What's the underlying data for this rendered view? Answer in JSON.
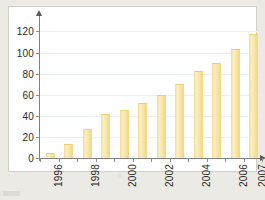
{
  "chart_data": {
    "type": "bar",
    "title": "",
    "subtitle": "",
    "xlabel": "",
    "ylabel": "",
    "categories": [
      "1996",
      "1997",
      "1998",
      "1999",
      "2000",
      "2001",
      "2002",
      "2003",
      "2004",
      "2005",
      "2006",
      "2007"
    ],
    "values": [
      4,
      12,
      27,
      41,
      45,
      51,
      59,
      69,
      82,
      89,
      102,
      117
    ],
    "series": [
      {
        "name": "",
        "values": [
          4,
          12,
          27,
          41,
          45,
          51,
          59,
          69,
          82,
          89,
          102,
          117
        ]
      }
    ],
    "ylim": [
      0,
      120
    ],
    "ytick_values": [
      0,
      20,
      40,
      60,
      80,
      100,
      120
    ],
    "ytick_labels": [
      "0",
      "20",
      "40",
      "60",
      "80",
      "100",
      "120"
    ],
    "visible_xtick_labels": [
      "1996",
      "",
      "1998",
      "",
      "2000",
      "",
      "2002",
      "",
      "2004",
      "",
      "2006",
      "2007"
    ],
    "xtick_label_rotation": -90,
    "grid": "horizontal",
    "legend": "none",
    "bar_color": "#f7e4a4",
    "bar_edge_color": "#e8cf78",
    "axis_color": "#808080",
    "gridline_color": "#e9eef2",
    "plot_background": "#ffffff",
    "figure_background": "#eceae4",
    "frame_border_color": "#d3d0c9",
    "text_color": "#2b2b2b"
  }
}
